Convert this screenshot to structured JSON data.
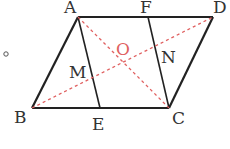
{
  "diagram": {
    "points": {
      "A": {
        "label": "A",
        "x": 78,
        "y": 17
      },
      "F": {
        "label": "F",
        "x": 148,
        "y": 17
      },
      "D": {
        "label": "D",
        "x": 213,
        "y": 17
      },
      "B": {
        "label": "B",
        "x": 32,
        "y": 108
      },
      "E": {
        "label": "E",
        "x": 100,
        "y": 108
      },
      "C": {
        "label": "C",
        "x": 169,
        "y": 108
      },
      "O": {
        "label": "O"
      },
      "M": {
        "label": "M"
      },
      "N": {
        "label": "N"
      }
    },
    "colors": {
      "solid": "#222222",
      "dashed": "#e06060",
      "label": "#333333",
      "label_o": "#e06060"
    },
    "marker": "°"
  }
}
